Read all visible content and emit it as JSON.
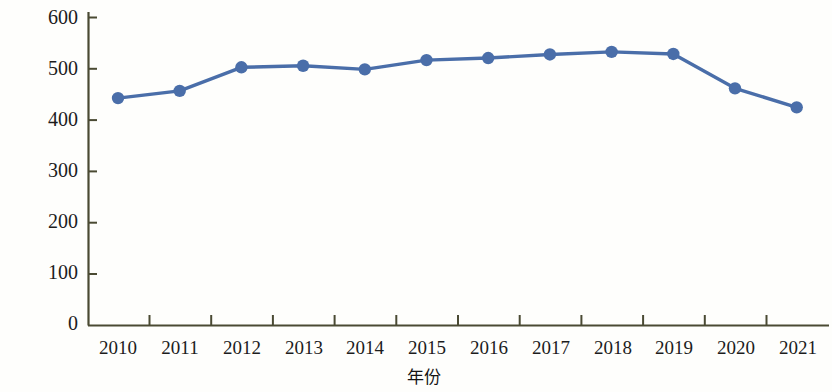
{
  "chart_data": {
    "type": "line",
    "title": "",
    "xlabel": "年份",
    "ylabel": "CO₂排放量/万t",
    "ylabel_parts": {
      "prefix": "CO",
      "sub": "2",
      "suffix": "排放量/万t"
    },
    "categories": [
      "2010",
      "2011",
      "2012",
      "2013",
      "2014",
      "2015",
      "2016",
      "2017",
      "2018",
      "2019",
      "2020",
      "2021"
    ],
    "values": [
      443,
      457,
      503,
      506,
      499,
      517,
      521,
      528,
      533,
      529,
      462,
      425
    ],
    "series": [
      {
        "name": "CO₂排放量",
        "values": [
          443,
          457,
          503,
          506,
          499,
          517,
          521,
          528,
          533,
          529,
          462,
          425
        ],
        "color": "#4a6ea9",
        "marker": "circle",
        "line_width": 3
      }
    ],
    "ylim": [
      0,
      600
    ],
    "yticks": [
      0,
      100,
      200,
      300,
      400,
      500,
      600
    ],
    "ytick_labels": [
      "0",
      "100",
      "200",
      "300",
      "400",
      "500",
      "600"
    ],
    "xtick_labels": [
      "2010",
      "2011",
      "2012",
      "2013",
      "2014",
      "2015",
      "2016",
      "2017",
      "2018",
      "2019",
      "2020",
      "2021"
    ],
    "grid": false,
    "legend": null,
    "legend_position": "none",
    "axis_color": "#4a4a33",
    "tick_direction": "in",
    "spines": [
      "left",
      "bottom"
    ]
  },
  "colors": {
    "series_blue": "#4a6ea9",
    "axis": "#4a4a33",
    "text": "#1c1c1c",
    "background": "#fefefc"
  }
}
